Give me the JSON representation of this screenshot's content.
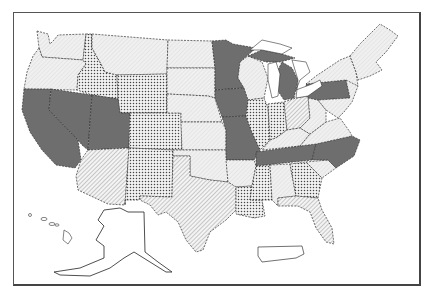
{
  "map": {
    "type": "choropleth",
    "region": "United States",
    "legend": null,
    "fills": {
      "solid": "#6e6e6e",
      "dots": "dotted pattern",
      "hatch": "diagonal hatch pattern",
      "light": "light stipple pattern"
    },
    "categories": {
      "solid": [
        "CA",
        "NV",
        "UT",
        "MN",
        "IA",
        "MO",
        "MI",
        "PA",
        "TN",
        "NC"
      ],
      "dots": [
        "ID",
        "WY",
        "CO",
        "NM",
        "IL",
        "IN",
        "LA",
        "MS",
        "GA",
        "AR-south"
      ],
      "hatch": [
        "AZ",
        "TX",
        "OH",
        "FL",
        "OK-east"
      ],
      "light": [
        "WA",
        "OR",
        "MT",
        "ND",
        "SD",
        "NE",
        "KS",
        "OK",
        "WI",
        "KY",
        "AL",
        "SC",
        "VA",
        "WV",
        "NY",
        "ME",
        "VT",
        "NH",
        "MA",
        "AR",
        "AK",
        "HI"
      ]
    },
    "insets": [
      "Alaska",
      "Hawaii",
      "Puerto Rico"
    ]
  }
}
